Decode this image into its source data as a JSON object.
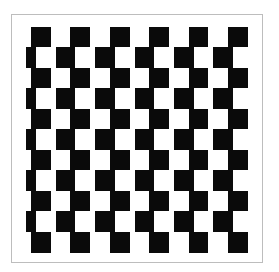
{
  "figure": {
    "title": "",
    "kind": "offset checkerboard illusion",
    "colors": {
      "dark": "#0a0a0a",
      "light": "#ffffff",
      "frame": "#bdbdbd"
    },
    "board": {
      "left": 26,
      "right": 248,
      "top": 27,
      "bottom": 252,
      "rows": 11,
      "row_height": 20.5,
      "cell_width": 19.7
    },
    "rows": [
      {
        "start_x": 31,
        "first": "black",
        "cells": 11
      },
      {
        "start_x": 26,
        "first": "black_narrow",
        "cells": 12
      },
      {
        "start_x": 31,
        "first": "black",
        "cells": 11
      },
      {
        "start_x": 26,
        "first": "black_narrow",
        "cells": 12
      },
      {
        "start_x": 31,
        "first": "black",
        "cells": 11
      },
      {
        "start_x": 26,
        "first": "black_narrow",
        "cells": 12
      },
      {
        "start_x": 31,
        "first": "black",
        "cells": 11
      },
      {
        "start_x": 26,
        "first": "black_narrow",
        "cells": 12
      },
      {
        "start_x": 31,
        "first": "black",
        "cells": 11
      },
      {
        "start_x": 26,
        "first": "black_narrow",
        "cells": 12
      },
      {
        "start_x": 31,
        "first": "black",
        "cells": 11
      }
    ]
  }
}
